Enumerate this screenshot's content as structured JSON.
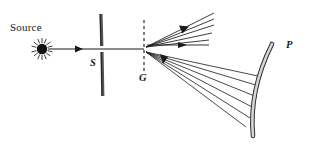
{
  "figure": {
    "background_color": "#ffffff",
    "ink_color": "#1a1a1a",
    "width": 310,
    "height": 153
  },
  "labels": {
    "source": "Source",
    "slit": "S",
    "grating": "G",
    "mirror": "P"
  },
  "components": {
    "source_lamp": {
      "name": "point-source",
      "icon": "starburst-icon",
      "center_x": 42,
      "center_y": 49,
      "dot_radius": 5,
      "ray_count": 16,
      "ray_inner": 6,
      "ray_outer": 11
    },
    "incident_beam": {
      "name": "incident-beam-arrow",
      "x1": 48,
      "y1": 49,
      "x2": 98,
      "y2": 49,
      "arrow_at": 0.62
    },
    "slit": {
      "name": "slit-aperture",
      "x": 101,
      "top_bar": {
        "y1": 14,
        "y2": 46
      },
      "bottom_bar": {
        "y1": 52,
        "y2": 96
      },
      "thickness": 3
    },
    "grating": {
      "name": "grating-line",
      "x": 144,
      "y1": 20,
      "y2": 73,
      "dash": "3 3"
    },
    "axis": {
      "name": "optical-axis",
      "x1": 0,
      "y1": 49,
      "x2": 144,
      "y2": 49
    },
    "zero_order_beam": {
      "name": "zero-order-arrow",
      "x1": 147,
      "y1": 45,
      "x2": 209,
      "y2": 45,
      "arrow_at": 0.58
    },
    "upper_fan": {
      "name": "diffracted-orders-fan",
      "origin_x": 146,
      "origin_y": 47,
      "rays": [
        {
          "x2": 214,
          "y2": 13
        },
        {
          "x2": 214,
          "y2": 19
        },
        {
          "x2": 214,
          "y2": 25
        },
        {
          "x2": 212,
          "y2": 33
        },
        {
          "x2": 209,
          "y2": 40
        }
      ],
      "arrow_at": 0.62
    },
    "lower_fan": {
      "name": "mirror-bound-fan",
      "origin_x": 146,
      "origin_y": 52,
      "rays": [
        {
          "x2": 258,
          "y2": 76
        },
        {
          "x2": 259,
          "y2": 86
        },
        {
          "x2": 257,
          "y2": 97
        },
        {
          "x2": 254,
          "y2": 108
        },
        {
          "x2": 250,
          "y2": 118
        },
        {
          "x2": 246,
          "y2": 127
        }
      ],
      "arrow_at": 0.17
    },
    "mirror": {
      "name": "concave-mirror-arc",
      "path": "M 272 44 C 258 72, 250 104, 253 136",
      "thickness": 4,
      "fill": "#d8d8d8",
      "stroke": "#3a3a3a"
    }
  },
  "label_positions": {
    "source": {
      "x": 10,
      "y": 26
    },
    "slit": {
      "x": 90,
      "y": 59
    },
    "grating": {
      "x": 139,
      "y": 73
    },
    "mirror": {
      "x": 286,
      "y": 41
    }
  }
}
